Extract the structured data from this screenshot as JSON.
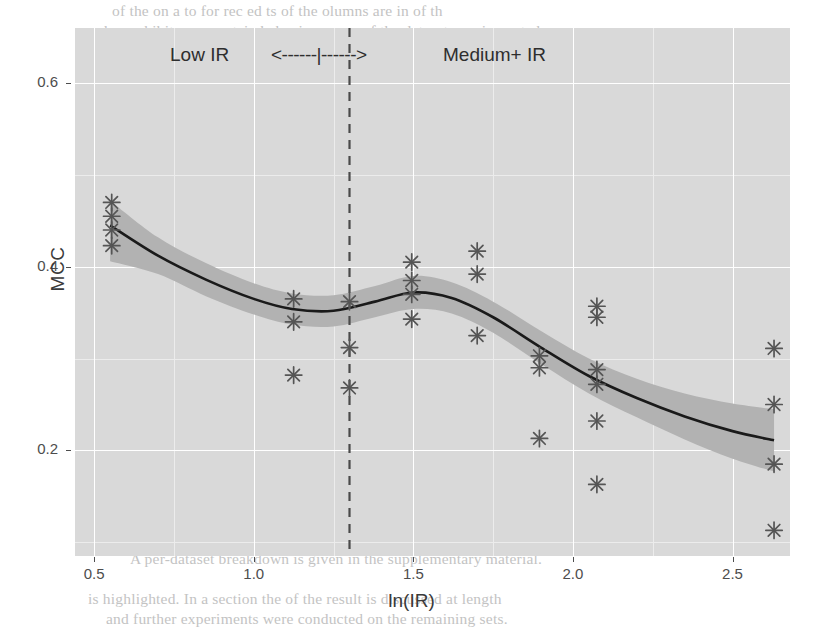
{
  "figure": {
    "background_color": "#ffffff",
    "panel_color": "#d9d9d9",
    "grid_major_color": "#ffffff",
    "ribbon_color": "#b2b2b2",
    "line_color": "#1a1a1a",
    "point_color": "#555555"
  },
  "axes": {
    "x_title": "ln(IR)",
    "y_title": "MCC",
    "x_ticks": [
      "0.5",
      "1.0",
      "1.5",
      "2.0",
      "2.5"
    ],
    "y_ticks": [
      "0.2",
      "0.4",
      "0.6"
    ]
  },
  "annotations": {
    "low_ir": "Low IR",
    "arrows": "<------|------>",
    "medium_ir": "Medium+ IR",
    "threshold_label": "1.3"
  },
  "bleed_text": [
    {
      "x": 112,
      "y": 2,
      "text": "of the  on     a   to     for  rec     ed  ts  of  the    olumns  are  in  of th"
    },
    {
      "x": 104,
      "y": 22,
      "text": "has exhibit an uncertain behavior: some of the datasets are impacted"
    },
    {
      "x": 116,
      "y": 44,
      "text": "substantial decrease in performance of the model, demonstrating not"
    },
    {
      "x": 122,
      "y": 66,
      "text": "matters that can be used as the improvement and they empir-"
    },
    {
      "x": 126,
      "y": 88,
      "text": "theoretical basis for the training process, our models are still sensitive"
    },
    {
      "x": 134,
      "y": 110,
      "text": "factors, and proposing a similar set of evaluations for a threshold"
    },
    {
      "x": 160,
      "y": 132,
      "text": "combination of the above as a reference point in our activity."
    },
    {
      "x": 92,
      "y": 176,
      "text": "Figure 4: Variation of the MCC with the size of the dataset imbalance"
    },
    {
      "x": 122,
      "y": 198,
      "text": "ratio, where each marker indicates a model evaluation on one dataset."
    },
    {
      "x": 96,
      "y": 220,
      "text": "As the imbalance ratio increases, the estimated performance of the"
    },
    {
      "x": 108,
      "y": 242,
      "text": "classifier shows a steady decline, with a local plateau around the"
    },
    {
      "x": 104,
      "y": 264,
      "text": "midrange. The shaded band is a 95% confidence interval produced from"
    },
    {
      "x": 116,
      "y": 286,
      "text": "a LOESS smoother. The dashed vertical line marks the boundary ln(IR)"
    },
    {
      "x": 122,
      "y": 308,
      "text": "= 1.3 used to separate the low and medium+ imbalance regimes, and"
    },
    {
      "x": 126,
      "y": 330,
      "text": "a systematic difference in the two groups is apparent in our results."
    },
    {
      "x": 106,
      "y": 352,
      "text": "Although we do not claim a causal link between the two, the collected"
    },
    {
      "x": 130,
      "y": 374,
      "text": "measurements suggest that methods designed to handle imbalance"
    },
    {
      "x": 100,
      "y": 396,
      "text": "should be preferred when the ratio exceeds this threshold value."
    },
    {
      "x": 118,
      "y": 418,
      "text": "We also report that the relation is not strictly monotonic, and several"
    },
    {
      "x": 110,
      "y": 440,
      "text": "datasets in the medium range achieve better scores than expected"
    },
    {
      "x": 124,
      "y": 462,
      "text": "from the overall trend, which we attribute to class separability."
    },
    {
      "x": 96,
      "y": 484,
      "text": "In future work we intend to extend this analysis to more learners"
    },
    {
      "x": 120,
      "y": 506,
      "text": "and a larger collection of benchmark problems in order to confirm"
    },
    {
      "x": 108,
      "y": 528,
      "text": "the robustness of these observations under different conditions."
    },
    {
      "x": 130,
      "y": 550,
      "text": "A per-dataset breakdown is given in the supplementary material."
    },
    {
      "x": 88,
      "y": 590,
      "text": "is highlighted. In a section the   of  the result  is   discussed  at  length"
    },
    {
      "x": 106,
      "y": 610,
      "text": "and further   experiments   were   conducted   on  the  remaining  sets."
    }
  ],
  "chart_data": {
    "type": "scatter",
    "title": "",
    "xlabel": "ln(IR)",
    "ylabel": "MCC",
    "xlim": [
      0.44,
      2.68
    ],
    "ylim": [
      0.085,
      0.66
    ],
    "grid": true,
    "legend": null,
    "x_major_ticks": [
      0.5,
      1.0,
      1.5,
      2.0,
      2.5
    ],
    "y_major_ticks": [
      0.2,
      0.4,
      0.6
    ],
    "x_minor_ticks": [
      0.75,
      1.25,
      1.75,
      2.25
    ],
    "y_minor_ticks": [
      0.1,
      0.3,
      0.5
    ],
    "marker": "asterisk",
    "points": [
      {
        "x": 0.555,
        "y": 0.47
      },
      {
        "x": 0.555,
        "y": 0.455
      },
      {
        "x": 0.555,
        "y": 0.44
      },
      {
        "x": 0.555,
        "y": 0.423
      },
      {
        "x": 1.125,
        "y": 0.365
      },
      {
        "x": 1.125,
        "y": 0.34
      },
      {
        "x": 1.125,
        "y": 0.282
      },
      {
        "x": 1.3,
        "y": 0.362
      },
      {
        "x": 1.3,
        "y": 0.312
      },
      {
        "x": 1.3,
        "y": 0.268
      },
      {
        "x": 1.495,
        "y": 0.405
      },
      {
        "x": 1.495,
        "y": 0.385
      },
      {
        "x": 1.495,
        "y": 0.37
      },
      {
        "x": 1.495,
        "y": 0.343
      },
      {
        "x": 1.7,
        "y": 0.417
      },
      {
        "x": 1.7,
        "y": 0.392
      },
      {
        "x": 1.7,
        "y": 0.325
      },
      {
        "x": 1.895,
        "y": 0.303
      },
      {
        "x": 1.895,
        "y": 0.29
      },
      {
        "x": 1.895,
        "y": 0.213
      },
      {
        "x": 2.075,
        "y": 0.357
      },
      {
        "x": 2.075,
        "y": 0.345
      },
      {
        "x": 2.075,
        "y": 0.288
      },
      {
        "x": 2.075,
        "y": 0.272
      },
      {
        "x": 2.075,
        "y": 0.232
      },
      {
        "x": 2.075,
        "y": 0.163
      },
      {
        "x": 2.63,
        "y": 0.311
      },
      {
        "x": 2.63,
        "y": 0.25
      },
      {
        "x": 2.63,
        "y": 0.185
      },
      {
        "x": 2.63,
        "y": 0.113
      }
    ],
    "smooth_line": {
      "name": "LOESS fit",
      "x": [
        0.55,
        0.7,
        0.85,
        1.0,
        1.12,
        1.25,
        1.38,
        1.5,
        1.62,
        1.75,
        1.9,
        2.05,
        2.2,
        2.35,
        2.5,
        2.63
      ],
      "y": [
        0.445,
        0.412,
        0.386,
        0.365,
        0.354,
        0.352,
        0.362,
        0.372,
        0.366,
        0.345,
        0.312,
        0.281,
        0.257,
        0.237,
        0.221,
        0.211
      ],
      "upper": [
        0.472,
        0.432,
        0.404,
        0.382,
        0.371,
        0.369,
        0.379,
        0.39,
        0.383,
        0.362,
        0.33,
        0.3,
        0.278,
        0.262,
        0.251,
        0.245
      ],
      "lower": [
        0.406,
        0.392,
        0.368,
        0.348,
        0.337,
        0.335,
        0.345,
        0.354,
        0.349,
        0.328,
        0.294,
        0.262,
        0.236,
        0.212,
        0.191,
        0.177
      ]
    },
    "threshold_line": {
      "x": 1.3,
      "style": "dashed"
    }
  }
}
